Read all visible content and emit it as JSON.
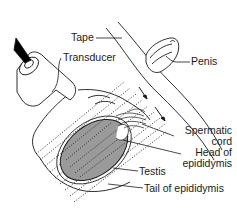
{
  "figure": {
    "type": "anatomical-illustration",
    "labels": {
      "tape": "Tape",
      "transducer": "Transducer",
      "penis": "Penis",
      "spermatic_cord_line1": "Spermatic",
      "spermatic_cord_line2": "cord",
      "head_epididymis_line1": "Head of",
      "head_epididymis_line2": "epididymis",
      "testis": "Testis",
      "tail_epididymis": "Tail of epididymis"
    },
    "colors": {
      "line": "#1a1a1a",
      "testis_fill": "#9a9a9a",
      "probe_tip": "#000000",
      "background": "#ffffff"
    }
  }
}
